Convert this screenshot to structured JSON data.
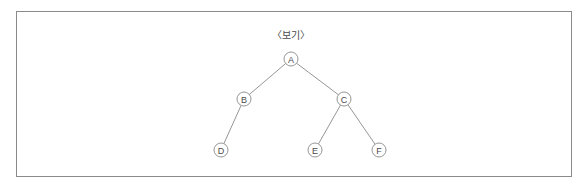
{
  "canvas": {
    "width": 588,
    "height": 189,
    "background": "#ffffff"
  },
  "frame": {
    "border_color": "#8a8a8a",
    "fill": "#ffffff"
  },
  "caption": {
    "text": "〈보기〉",
    "x": 291,
    "y": 34,
    "color": "#4a4a4a"
  },
  "chart_data": {
    "type": "diagram",
    "subtype": "binary-tree",
    "title": "〈보기〉",
    "node_radius": 7,
    "stroke_color": "#8a8a8a",
    "node_fill": "#ffffff",
    "nodes": [
      {
        "id": "A",
        "label": "A",
        "x": 291,
        "y": 59,
        "level": 0
      },
      {
        "id": "B",
        "label": "B",
        "x": 244,
        "y": 99,
        "level": 1
      },
      {
        "id": "C",
        "label": "C",
        "x": 344,
        "y": 99,
        "level": 1
      },
      {
        "id": "D",
        "label": "D",
        "x": 221,
        "y": 150,
        "level": 2
      },
      {
        "id": "E",
        "label": "E",
        "x": 315,
        "y": 150,
        "level": 2
      },
      {
        "id": "F",
        "label": "F",
        "x": 379,
        "y": 150,
        "level": 2
      }
    ],
    "edges": [
      {
        "from": "A",
        "to": "B",
        "side": "left"
      },
      {
        "from": "A",
        "to": "C",
        "side": "right"
      },
      {
        "from": "B",
        "to": "D",
        "side": "left"
      },
      {
        "from": "C",
        "to": "E",
        "side": "left"
      },
      {
        "from": "C",
        "to": "F",
        "side": "right"
      }
    ]
  }
}
